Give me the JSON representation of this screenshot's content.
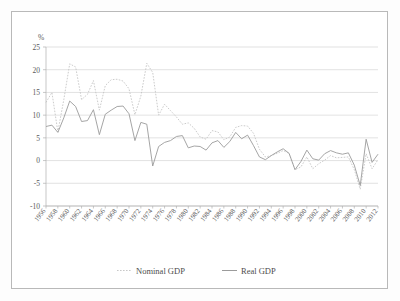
{
  "chart_data": {
    "type": "line",
    "title": "",
    "subtitle": "",
    "xlabel": "",
    "ylabel": "%",
    "ylim": [
      -10,
      25
    ],
    "yticks": [
      25,
      20,
      15,
      10,
      5,
      0,
      -5,
      -10
    ],
    "ytick_labels": [
      "25",
      "20",
      "15",
      "10",
      "5",
      "0",
      "-5",
      "-10"
    ],
    "grid": true,
    "legend_position": "bottom",
    "x": [
      1956,
      1957,
      1958,
      1959,
      1960,
      1961,
      1962,
      1963,
      1964,
      1965,
      1966,
      1967,
      1968,
      1969,
      1970,
      1971,
      1972,
      1973,
      1974,
      1975,
      1976,
      1977,
      1978,
      1979,
      1980,
      1981,
      1982,
      1983,
      1984,
      1985,
      1986,
      1987,
      1988,
      1989,
      1990,
      1991,
      1992,
      1993,
      1994,
      1995,
      1996,
      1997,
      1998,
      1999,
      2000,
      2001,
      2002,
      2003,
      2004,
      2005,
      2006,
      2007,
      2008,
      2009,
      2010,
      2011,
      2012
    ],
    "xtick_labels": [
      "1956",
      "1958",
      "1960",
      "1962",
      "1964",
      "1966",
      "1968",
      "1970",
      "1972",
      "1974",
      "1976",
      "1978",
      "1980",
      "1982",
      "1984",
      "1986",
      "1988",
      "1990",
      "1992",
      "1994",
      "1996",
      "1998",
      "2000",
      "2002",
      "2004",
      "2006",
      "2008",
      "2010",
      "2012"
    ],
    "series": [
      {
        "name": "Nominal GDP",
        "style": "dotted",
        "color": "#c2c2c2",
        "values": [
          12.8,
          15.0,
          6.3,
          13.4,
          21.3,
          20.6,
          13.4,
          14.6,
          17.6,
          11.1,
          16.5,
          17.8,
          17.9,
          17.5,
          15.8,
          10.1,
          14.2,
          21.4,
          19.4,
          10.0,
          12.4,
          11.0,
          9.6,
          8.0,
          8.3,
          7.1,
          5.2,
          4.7,
          6.6,
          6.3,
          4.6,
          5.2,
          7.3,
          7.7,
          7.6,
          6.0,
          2.5,
          0.8,
          1.1,
          1.6,
          2.2,
          1.6,
          -2.0,
          -1.4,
          0.8,
          -1.8,
          -0.7,
          0.1,
          1.1,
          0.6,
          0.7,
          0.8,
          -2.0,
          -6.3,
          1.5,
          -1.8,
          0.2
        ]
      },
      {
        "name": "Real GDP",
        "style": "solid",
        "color": "#9b9b9b",
        "values": [
          7.5,
          7.8,
          6.2,
          9.4,
          13.1,
          11.9,
          8.6,
          8.8,
          11.2,
          5.7,
          10.2,
          11.1,
          11.9,
          12.0,
          10.3,
          4.4,
          8.4,
          8.0,
          -1.2,
          3.1,
          4.0,
          4.4,
          5.3,
          5.5,
          2.8,
          3.2,
          3.1,
          2.3,
          3.9,
          4.4,
          2.9,
          4.2,
          6.2,
          4.8,
          5.6,
          3.3,
          0.8,
          0.2,
          1.1,
          1.9,
          2.6,
          1.6,
          -2.0,
          -0.2,
          2.3,
          0.4,
          0.1,
          1.5,
          2.2,
          1.7,
          1.4,
          1.7,
          -1.0,
          -5.5,
          4.7,
          -0.4,
          1.4
        ]
      }
    ],
    "legend": [
      "Nominal GDP",
      "Real GDP"
    ]
  },
  "axis": {
    "y_unit_label": "%"
  },
  "legend": {
    "nominal_label": "Nominal GDP",
    "real_label": "Real GDP"
  },
  "colors": {
    "nominal": "#c2c2c2",
    "real": "#9b9b9b",
    "grid": "#cfcfcf",
    "frame": "#b9b9b9",
    "text": "#5a5a5a"
  }
}
